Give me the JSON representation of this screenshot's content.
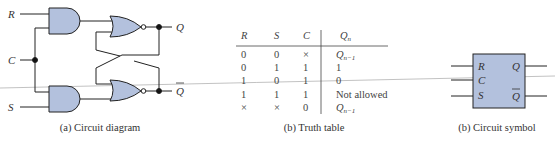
{
  "colors": {
    "gate_fill": "#b3c1dd",
    "stroke": "#222222"
  },
  "circuit": {
    "inputs": {
      "r": "R",
      "c": "C",
      "s": "S"
    },
    "outputs": {
      "q": "Q",
      "qbar": "Q"
    },
    "caption": "(a) Circuit diagram"
  },
  "truth_table": {
    "headers": {
      "r": "R",
      "s": "S",
      "c": "C",
      "q": "Q",
      "q_sub": "n"
    },
    "rows": [
      {
        "r": "0",
        "s": "0",
        "c": "×",
        "q": "Q",
        "q_sub": "n−1"
      },
      {
        "r": "0",
        "s": "1",
        "c": "1",
        "q": "1",
        "q_sub": ""
      },
      {
        "r": "1",
        "s": "0",
        "c": "1",
        "q": "0",
        "q_sub": ""
      },
      {
        "r": "1",
        "s": "1",
        "c": "1",
        "q": "Not allowed",
        "q_sub": ""
      },
      {
        "r": "×",
        "s": "×",
        "c": "0",
        "q": "Q",
        "q_sub": "n−1"
      }
    ],
    "caption": "(b) Truth table"
  },
  "symbol": {
    "pins": {
      "r": "R",
      "c": "C",
      "s": "S",
      "q": "Q",
      "qbar": "Q"
    },
    "caption": "(b) Circuit symbol"
  }
}
